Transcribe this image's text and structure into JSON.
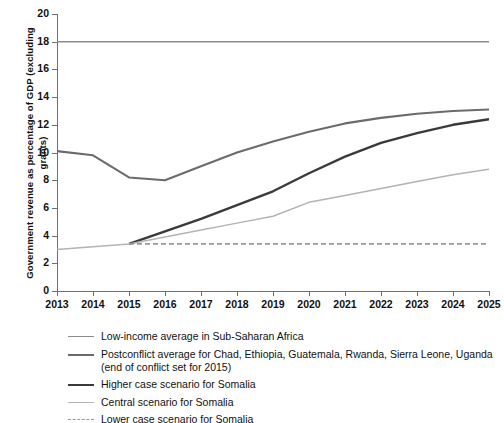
{
  "chart_data": {
    "type": "line",
    "title": "",
    "xlabel": "",
    "ylabel": "Government revenue as percentage of GDP (excluding grants)",
    "x": [
      2013,
      2014,
      2015,
      2016,
      2017,
      2018,
      2019,
      2020,
      2021,
      2022,
      2023,
      2024,
      2025
    ],
    "xticklabels": [
      "2013",
      "2014",
      "2015",
      "2016",
      "2017",
      "2018",
      "2019",
      "2020",
      "2021",
      "2022",
      "2023",
      "2024",
      "2025"
    ],
    "yticklabels": [
      "0",
      "2",
      "4",
      "6",
      "8",
      "10",
      "12",
      "14",
      "16",
      "18",
      "20"
    ],
    "yticks": [
      0,
      2,
      4,
      6,
      8,
      10,
      12,
      14,
      16,
      18,
      20
    ],
    "ylim": [
      0,
      20
    ],
    "xlim": [
      2013,
      2025
    ],
    "grid": false,
    "legend_position": "below",
    "series": [
      {
        "name": "Low-income average in Sub-Saharan Africa",
        "color": "#8c8c8c",
        "width": 1.6,
        "dash": "none",
        "x": [
          2013,
          2025
        ],
        "values": [
          18.0,
          18.0
        ]
      },
      {
        "name": "Postconflict average for Chad, Ethiopia, Guatemala, Rwanda, Sierra Leone, Uganda (end of conflict set for 2015)",
        "color": "#6b6b6b",
        "width": 2.1,
        "dash": "none",
        "x": [
          2013,
          2014,
          2015,
          2016,
          2017,
          2018,
          2019,
          2020,
          2021,
          2022,
          2023,
          2024,
          2025
        ],
        "values": [
          10.1,
          9.8,
          8.2,
          8.0,
          9.0,
          10.0,
          10.8,
          11.5,
          12.1,
          12.5,
          12.8,
          13.0,
          13.1
        ]
      },
      {
        "name": "Higher case scenario for Somalia",
        "color": "#3a3a3a",
        "width": 2.4,
        "dash": "none",
        "x": [
          2015,
          2016,
          2017,
          2018,
          2019,
          2020,
          2021,
          2022,
          2023,
          2024,
          2025
        ],
        "values": [
          3.4,
          4.3,
          5.2,
          6.2,
          7.2,
          8.5,
          9.7,
          10.7,
          11.4,
          12.0,
          12.4
        ]
      },
      {
        "name": "Central scenario for Somalia",
        "color": "#b3b3b3",
        "width": 1.5,
        "dash": "none",
        "x": [
          2013,
          2014,
          2015,
          2016,
          2017,
          2018,
          2019,
          2020,
          2021,
          2022,
          2023,
          2024,
          2025
        ],
        "values": [
          3.0,
          3.2,
          3.4,
          3.9,
          4.4,
          4.9,
          5.4,
          6.4,
          6.9,
          7.4,
          7.9,
          8.4,
          8.8
        ]
      },
      {
        "name": "Lower case scenario for Somalia",
        "color": "#9a9a9a",
        "width": 1.8,
        "dash": "5,3",
        "x": [
          2015,
          2025
        ],
        "values": [
          3.4,
          3.4
        ]
      }
    ],
    "legend": [
      {
        "label": "Low-income average in Sub-Saharan Africa",
        "color": "#8c8c8c",
        "width": 1.6,
        "dash": "none"
      },
      {
        "label": "Postconflict average for Chad, Ethiopia, Guatemala, Rwanda, Sierra Leone, Uganda (end of conflict set for 2015)",
        "color": "#6b6b6b",
        "width": 2.1,
        "dash": "none"
      },
      {
        "label": "Higher case scenario for Somalia",
        "color": "#3a3a3a",
        "width": 2.6,
        "dash": "none"
      },
      {
        "label": "Central scenario for Somalia",
        "color": "#b3b3b3",
        "width": 1.5,
        "dash": "none"
      },
      {
        "label": "Lower case scenario for Somalia",
        "color": "#9a9a9a",
        "width": 1.8,
        "dash": "4,3"
      }
    ]
  }
}
